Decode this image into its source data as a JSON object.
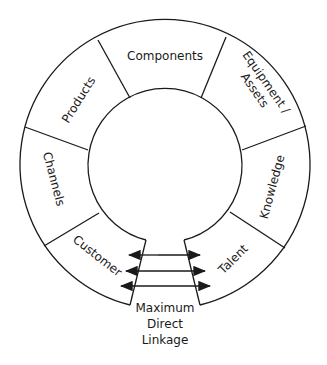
{
  "diagram": {
    "type": "ring",
    "segments": [
      {
        "label": "Components"
      },
      {
        "label": "Equipment /"
      },
      {
        "label": "Assets"
      },
      {
        "label": "Knowledge"
      },
      {
        "label": "Talent"
      },
      {
        "label": "Customer"
      },
      {
        "label": "Channels"
      },
      {
        "label": "Products"
      }
    ],
    "linkage": {
      "line1": "Maximum",
      "line2": "Direct",
      "line3": "Linkage",
      "arrow_count": 3
    },
    "colors": {
      "stroke": "#1a1a1a",
      "background": "#ffffff"
    }
  }
}
